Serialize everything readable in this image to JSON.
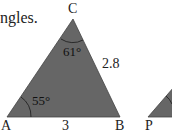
{
  "heading": "ngles.",
  "triangle_abc": {
    "vertices": {
      "A": "A",
      "B": "B",
      "C": "C"
    },
    "side_ab": "3",
    "side_bc": "2.8",
    "angle_a": "55°",
    "angle_c": "61°",
    "fill": "#666666"
  },
  "triangle_pqr": {
    "vertices": {
      "P": "P"
    },
    "fill": "#666666"
  }
}
